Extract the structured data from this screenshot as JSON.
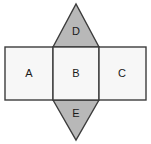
{
  "figure": {
    "background_color": "#ffffff",
    "stroke_color": "#3c3c3c",
    "stroke_width": 1.4,
    "rectangle_fill": "#f7f7f7",
    "triangle_fill": "#b8b8b8",
    "label_color": "#1a1a1a"
  },
  "faces": {
    "rectangle_a": {
      "label": "A",
      "shape": "rectangle",
      "fill": "#f7f7f7",
      "x": 5,
      "y": 47,
      "width": 48,
      "height": 53,
      "label_x": 29,
      "label_y": 74.5
    },
    "rectangle_b": {
      "label": "B",
      "shape": "rectangle",
      "fill": "#f7f7f7",
      "x": 53,
      "y": 47,
      "width": 46,
      "height": 53,
      "label_x": 76,
      "label_y": 74.5
    },
    "rectangle_c": {
      "label": "C",
      "shape": "rectangle",
      "fill": "#f7f7f7",
      "x": 99,
      "y": 47,
      "width": 47,
      "height": 53,
      "label_x": 122,
      "label_y": 74.5
    },
    "triangle_d": {
      "label": "D",
      "shape": "triangle",
      "direction": "up",
      "fill": "#b8b8b8",
      "points": "53,47 76,4 99,47",
      "label_x": 76,
      "label_y": 32
    },
    "triangle_e": {
      "label": "E",
      "shape": "triangle",
      "direction": "down",
      "fill": "#b8b8b8",
      "points": "53,100 76,140 99,100",
      "label_x": 76,
      "label_y": 114
    }
  },
  "label_order": [
    "A",
    "B",
    "C",
    "D",
    "E"
  ]
}
